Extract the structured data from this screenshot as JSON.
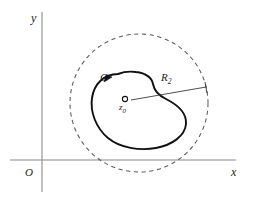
{
  "figure": {
    "title_alt": "Closed contour C about z0 inside dashed circle of radius R2",
    "axes": {
      "y_label": "y",
      "x_label": "x",
      "origin_label": "O",
      "axis_color": "#808080"
    },
    "contour": {
      "label": "C",
      "color": "#111111",
      "orientation": "counterclockwise"
    },
    "center": {
      "label_main": "z",
      "label_sub": "0",
      "marker": "open-circle",
      "color": "#111111"
    },
    "circle": {
      "label_main": "R",
      "label_sub": "2",
      "style": "dashed",
      "color": "#5a5a5a"
    },
    "radius_line": {
      "name": "radius-leader-line",
      "color": "#3a3a3a"
    }
  }
}
